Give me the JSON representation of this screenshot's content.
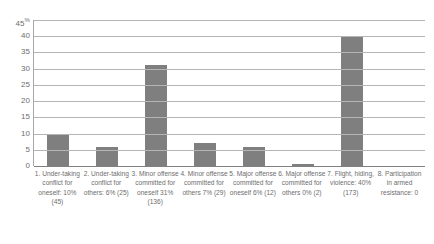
{
  "chart_data": {
    "type": "bar",
    "title": "",
    "xlabel": "",
    "ylabel": "",
    "ylim": [
      0,
      45
    ],
    "grid": true,
    "legend": false,
    "axis_unit": "%",
    "ytick_labels": [
      "45%",
      "40",
      "35",
      "30",
      "25",
      "20",
      "15",
      "10",
      "5",
      "0"
    ],
    "ytick_values": [
      45,
      40,
      35,
      30,
      25,
      20,
      15,
      10,
      5,
      0
    ],
    "categories": [
      "1. Undertaking conflict for oneself: 10% (45)",
      "2. Undertaking conflict for others: 6% (25)",
      "3. Minor offense committed for oneself 31% (136)",
      "4. Minor offense committed for others 7% (29)",
      "5. Major offense committed for oneself 6% (12)",
      "6. Major offense committed for others 0% (2)",
      "7. Flight, hiding, violence: 40% (173)",
      "8. Participation in armed resistance: 0"
    ],
    "values": [
      10,
      6,
      31,
      7,
      6,
      0.5,
      40,
      0
    ],
    "counts": [
      45,
      25,
      136,
      29,
      12,
      2,
      173,
      0
    ],
    "bar_color": "#7f7f7f"
  },
  "axis": {
    "ticks": [
      {
        "label": "45",
        "suffix": "%"
      },
      {
        "label": "40",
        "suffix": ""
      },
      {
        "label": "35",
        "suffix": ""
      },
      {
        "label": "30",
        "suffix": ""
      },
      {
        "label": "25",
        "suffix": ""
      },
      {
        "label": "20",
        "suffix": ""
      },
      {
        "label": "15",
        "suffix": ""
      },
      {
        "label": "10",
        "suffix": ""
      },
      {
        "label": "5",
        "suffix": ""
      },
      {
        "label": "0",
        "suffix": ""
      }
    ]
  },
  "category_labels": [
    "1. Under-taking conflict for oneself: 10% (45)",
    "2. Under-taking conflict for others: 6% (25)",
    "3. Minor offense committed for oneself 31% (136)",
    "4. Minor offense committed for others 7% (29)",
    "5. Major offense committed for oneself 6% (12)",
    "6. Major offense committed for others 0% (2)",
    "7. Flight, hiding, violence: 40% (173)",
    "8. Participation in armed resistance: 0"
  ]
}
